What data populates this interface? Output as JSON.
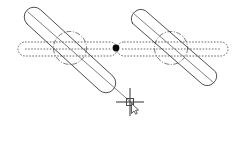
{
  "drawing": {
    "title": "Slotted Link Geometry",
    "background_color": "#ffffff",
    "line_color": "#3a3a3a",
    "hidden_line_color": "#4a4a4a",
    "centerline_color": "#555555",
    "snap_marker_color": "#0b0b0b",
    "width": 243,
    "height": 155
  },
  "labels": {
    "left_slot": "left-slanted-slot",
    "right_slot": "right-slanted-slot",
    "left_hidden_slot": "left-horizontal-hidden-slot",
    "right_hidden_slot": "right-horizontal-hidden-slot",
    "left_circle": "left-construction-circle",
    "right_circle": "right-construction-circle",
    "snap_point": "midpoint-snap-marker",
    "cursor": "crosshair-cursor"
  },
  "geometry": {
    "left_slot": {
      "start": [
        34,
        17
      ],
      "end": [
        106,
        83
      ],
      "half_width": 9.5,
      "angle_deg": 42.5
    },
    "right_slot": {
      "start": [
        139,
        17
      ],
      "end": [
        209,
        78
      ],
      "half_width": 9.5,
      "angle_deg": 41.0
    },
    "left_slot_centerline": {
      "start": [
        28,
        12
      ],
      "end": [
        132,
        103
      ]
    },
    "right_slot_centerline": {
      "start": [
        134,
        13
      ],
      "end": [
        213,
        82
      ]
    },
    "left_hidden_slot": {
      "start": [
        25,
        49
      ],
      "end": [
        110,
        49
      ],
      "half_width": 7.0
    },
    "right_hidden_slot": {
      "start": [
        124,
        49
      ],
      "end": [
        221,
        49
      ],
      "half_width": 7.0
    },
    "left_circle": {
      "center": [
        70,
        48
      ],
      "radius": 16.5
    },
    "right_circle": {
      "center": [
        171,
        48
      ],
      "radius": 16.5
    },
    "snap_point": {
      "center": [
        116,
        48
      ],
      "radius": 3.2
    },
    "cursor": {
      "center": [
        130,
        102
      ],
      "arm_length": 14,
      "pickbox_size": 7
    }
  }
}
